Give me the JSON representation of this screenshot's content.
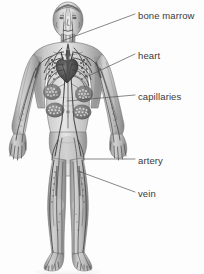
{
  "figure": {
    "background_color": "#fdfdfd",
    "text_color": "#3a3a3a",
    "leader_line_color": "#555555",
    "artwork_style": "grayscale pencil / airbrush anatomical illustration",
    "width": 204,
    "height": 274
  },
  "labels": [
    {
      "id": "bone-marrow",
      "text": "bone marrow",
      "x": 138,
      "y": 10,
      "leader": {
        "x1": 135,
        "y1": 14,
        "x2": 62,
        "y2": 41
      }
    },
    {
      "id": "heart",
      "text": "heart",
      "x": 138,
      "y": 50,
      "leader": {
        "x1": 135,
        "y1": 54,
        "x2": 84,
        "y2": 78
      }
    },
    {
      "id": "capillaries",
      "text": "capillaries",
      "x": 138,
      "y": 91,
      "leader": {
        "x1": 135,
        "y1": 95,
        "x2": 67,
        "y2": 101
      }
    },
    {
      "id": "artery",
      "text": "artery",
      "x": 138,
      "y": 155,
      "leader": {
        "x1": 135,
        "y1": 159,
        "x2": 84,
        "y2": 159
      }
    },
    {
      "id": "vein",
      "text": "vein",
      "x": 138,
      "y": 188,
      "leader": {
        "x1": 135,
        "y1": 192,
        "x2": 78,
        "y2": 171
      }
    }
  ],
  "anatomy": {
    "figure_bounds": {
      "left": 10,
      "top": 4,
      "right": 126,
      "bottom": 272
    },
    "parts": [
      "head",
      "neck",
      "torso",
      "left-arm",
      "right-arm",
      "left-hand",
      "right-hand",
      "pelvis",
      "left-leg",
      "right-leg",
      "left-foot",
      "right-foot"
    ],
    "systems_shown": [
      "arteries",
      "veins",
      "capillary-beds",
      "heart",
      "bone-marrow"
    ]
  }
}
